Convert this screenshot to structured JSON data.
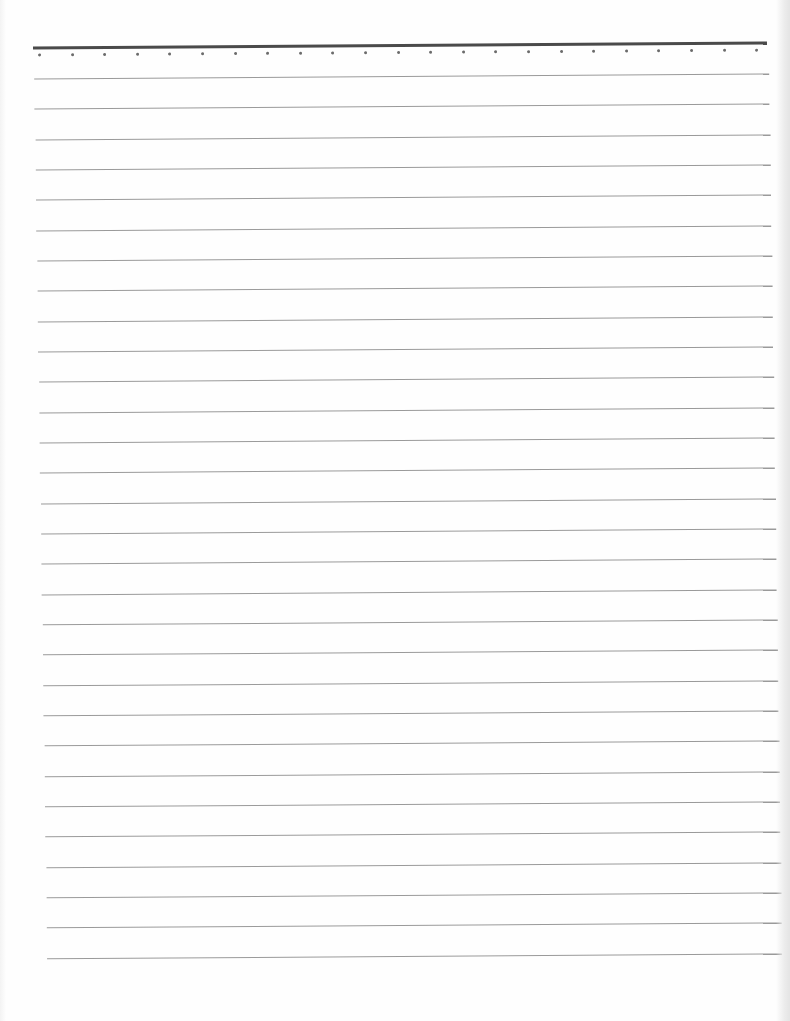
{
  "page": {
    "type": "blank lined writing paper",
    "background_color": "#fefefe",
    "top_rule": {
      "color": "#4a4a4a",
      "thickness_px": 3
    },
    "dot_row": {
      "count": 23,
      "color": "#6b6b6b",
      "spacing_px": 32.6
    },
    "ruled_lines": {
      "count": 30,
      "color": "#9a9a9a",
      "spacing_px": 30.33
    },
    "text_content": []
  }
}
